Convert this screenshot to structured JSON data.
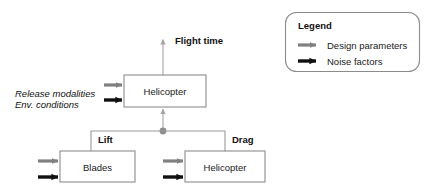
{
  "diagram": {
    "type": "block-flow-diagram",
    "colors": {
      "design_parameter_arrow": "#808080",
      "noise_factor_arrow": "#101010",
      "box_border": "#8c8c8c",
      "connector_line": "#9a9a9a",
      "junction_dot": "#8c8c8c",
      "text": "#111111",
      "background": "#ffffff"
    },
    "boxes": [
      {
        "id": "helicopter-top",
        "label": "Helicopter"
      },
      {
        "id": "blades",
        "label": "Blades"
      },
      {
        "id": "helicopter-bottom",
        "label": "Helicopter"
      }
    ],
    "inputs": [
      {
        "label": "Release modalities",
        "arrow_type": "design-parameter"
      },
      {
        "label": "Env. conditions",
        "arrow_type": "noise-factor"
      }
    ],
    "outputs": [
      {
        "label": "Flight time"
      }
    ],
    "flows": [
      {
        "label": "Lift",
        "from": "blades",
        "to": "helicopter-top"
      },
      {
        "label": "Drag",
        "from": "helicopter-bottom",
        "to": "helicopter-top"
      }
    ],
    "legend": {
      "title": "Legend",
      "entries": [
        {
          "label": "Design parameters",
          "arrow_type": "design-parameter",
          "color": "#808080"
        },
        {
          "label": "Noise factors",
          "arrow_type": "noise-factor",
          "color": "#101010"
        }
      ]
    }
  }
}
